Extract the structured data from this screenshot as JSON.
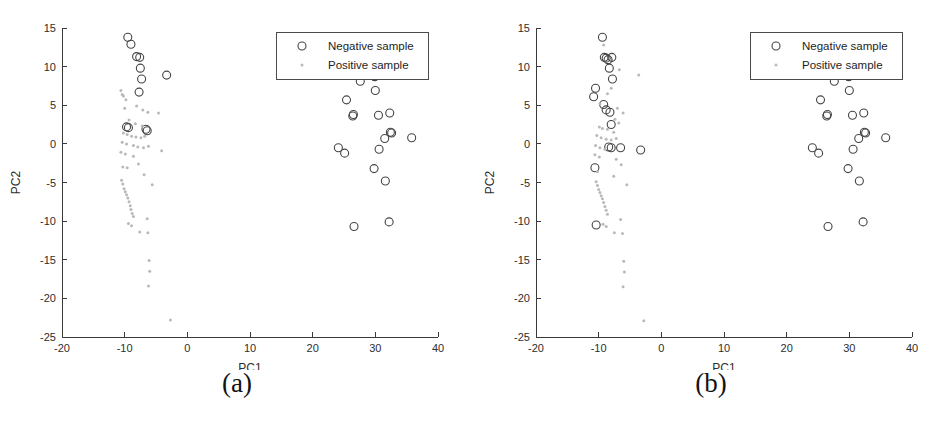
{
  "figure": {
    "panels": [
      {
        "caption": "(a)",
        "name": "panel-a"
      },
      {
        "caption": "(b)",
        "name": "panel-b"
      }
    ]
  },
  "legend": {
    "negative_label": "Negative sample",
    "positive_label": "Positive sample",
    "negative_marker": "circle-marker",
    "positive_marker": "dot-marker"
  },
  "colors": {
    "negative_marker": "#444444",
    "positive_marker": "#b9b9b9",
    "axis": "#3a3a3a",
    "text": "#2e2e2e",
    "background": "#ffffff"
  },
  "chart_data": [
    {
      "type": "scatter",
      "title": "(a)",
      "xlabel": "PC1",
      "ylabel": "PC2",
      "xlim": [
        -20,
        40
      ],
      "ylim": [
        -25,
        15
      ],
      "xticks": [
        -20,
        -10,
        0,
        10,
        20,
        30,
        40
      ],
      "yticks": [
        15,
        10,
        5,
        0,
        -5,
        -10,
        -15,
        -20,
        -25
      ],
      "grid": false,
      "legend_position": "top-right",
      "series": [
        {
          "name": "Negative sample",
          "marker": "circle",
          "points": [
            [
              -9.5,
              13.8
            ],
            [
              -9.0,
              12.9
            ],
            [
              -8.1,
              11.3
            ],
            [
              -7.6,
              11.2
            ],
            [
              -7.5,
              9.8
            ],
            [
              -7.3,
              8.4
            ],
            [
              -7.7,
              6.7
            ],
            [
              -3.3,
              8.9
            ],
            [
              -9.7,
              2.2
            ],
            [
              -9.4,
              2.1
            ],
            [
              -6.6,
              1.9
            ],
            [
              -6.4,
              1.7
            ],
            [
              27.6,
              8.1
            ],
            [
              29.9,
              8.7
            ],
            [
              30.0,
              6.9
            ],
            [
              25.4,
              5.7
            ],
            [
              26.5,
              3.8
            ],
            [
              26.4,
              3.6
            ],
            [
              30.5,
              3.7
            ],
            [
              32.3,
              4.0
            ],
            [
              32.4,
              1.5
            ],
            [
              32.6,
              1.4
            ],
            [
              31.5,
              0.7
            ],
            [
              35.8,
              0.8
            ],
            [
              24.1,
              -0.5
            ],
            [
              25.1,
              -1.2
            ],
            [
              30.6,
              -0.7
            ],
            [
              29.8,
              -3.2
            ],
            [
              31.6,
              -4.8
            ],
            [
              26.6,
              -10.7
            ],
            [
              32.2,
              -10.1
            ]
          ]
        },
        {
          "name": "Positive sample",
          "marker": "dot",
          "points": [
            [
              -10.6,
              6.9
            ],
            [
              -10.4,
              6.4
            ],
            [
              -10.2,
              6.2
            ],
            [
              -9.8,
              5.7
            ],
            [
              -10.0,
              4.6
            ],
            [
              -8.1,
              4.9
            ],
            [
              -7.1,
              4.4
            ],
            [
              -6.3,
              4.1
            ],
            [
              -4.6,
              4.0
            ],
            [
              -9.3,
              3.1
            ],
            [
              -8.3,
              2.6
            ],
            [
              -7.2,
              2.3
            ],
            [
              -10.2,
              1.4
            ],
            [
              -9.6,
              1.2
            ],
            [
              -8.9,
              1.0
            ],
            [
              -8.2,
              0.9
            ],
            [
              -7.4,
              0.8
            ],
            [
              -6.8,
              1.0
            ],
            [
              -10.4,
              0.2
            ],
            [
              -9.7,
              0.0
            ],
            [
              -8.6,
              -0.2
            ],
            [
              -7.9,
              -0.4
            ],
            [
              -7.0,
              -0.5
            ],
            [
              -6.2,
              -0.3
            ],
            [
              -4.1,
              -0.9
            ],
            [
              -10.6,
              -1.1
            ],
            [
              -9.9,
              -1.3
            ],
            [
              -8.6,
              -1.6
            ],
            [
              -10.3,
              -3.0
            ],
            [
              -9.6,
              -3.1
            ],
            [
              -7.8,
              -2.6
            ],
            [
              -6.9,
              -4.0
            ],
            [
              -5.6,
              -5.3
            ],
            [
              -10.5,
              -4.7
            ],
            [
              -10.3,
              -5.2
            ],
            [
              -10.1,
              -5.8
            ],
            [
              -9.9,
              -6.2
            ],
            [
              -9.7,
              -6.6
            ],
            [
              -9.5,
              -7.0
            ],
            [
              -9.3,
              -7.5
            ],
            [
              -9.1,
              -8.0
            ],
            [
              -9.0,
              -8.5
            ],
            [
              -8.8,
              -9.0
            ],
            [
              -8.6,
              -9.4
            ],
            [
              -6.4,
              -9.7
            ],
            [
              -9.4,
              -10.3
            ],
            [
              -8.9,
              -10.6
            ],
            [
              -7.6,
              -11.4
            ],
            [
              -6.3,
              -11.5
            ],
            [
              -6.1,
              -15.1
            ],
            [
              -6.0,
              -16.5
            ],
            [
              -6.2,
              -18.4
            ],
            [
              -2.7,
              -22.8
            ]
          ]
        }
      ]
    },
    {
      "type": "scatter",
      "title": "(b)",
      "xlabel": "PC1",
      "ylabel": "PC2",
      "xlim": [
        -20,
        40
      ],
      "ylim": [
        -25,
        15
      ],
      "xticks": [
        -20,
        -10,
        0,
        10,
        20,
        30,
        40
      ],
      "yticks": [
        15,
        10,
        5,
        0,
        -5,
        -10,
        -15,
        -20,
        -25
      ],
      "grid": false,
      "legend_position": "top-right",
      "series": [
        {
          "name": "Negative sample",
          "marker": "circle",
          "points": [
            [
              -9.4,
              13.8
            ],
            [
              -9.1,
              11.2
            ],
            [
              -8.8,
              11.1
            ],
            [
              -8.5,
              10.9
            ],
            [
              -7.9,
              11.2
            ],
            [
              -8.3,
              9.8
            ],
            [
              -7.8,
              8.4
            ],
            [
              -10.5,
              7.2
            ],
            [
              -10.8,
              6.1
            ],
            [
              -9.2,
              5.1
            ],
            [
              -8.8,
              4.4
            ],
            [
              -8.2,
              4.1
            ],
            [
              -8.0,
              2.5
            ],
            [
              -8.4,
              -0.4
            ],
            [
              -8.0,
              -0.5
            ],
            [
              -6.5,
              -0.5
            ],
            [
              -3.3,
              -0.8
            ],
            [
              -10.6,
              -3.1
            ],
            [
              -10.4,
              -10.5
            ],
            [
              27.6,
              8.1
            ],
            [
              29.9,
              8.7
            ],
            [
              30.0,
              6.9
            ],
            [
              25.4,
              5.7
            ],
            [
              26.5,
              3.8
            ],
            [
              26.4,
              3.6
            ],
            [
              30.5,
              3.7
            ],
            [
              32.3,
              4.0
            ],
            [
              32.4,
              1.5
            ],
            [
              32.6,
              1.4
            ],
            [
              31.5,
              0.7
            ],
            [
              35.8,
              0.8
            ],
            [
              24.1,
              -0.5
            ],
            [
              25.1,
              -1.2
            ],
            [
              30.6,
              -0.7
            ],
            [
              29.8,
              -3.2
            ],
            [
              31.6,
              -4.8
            ],
            [
              26.6,
              -10.7
            ],
            [
              32.2,
              -10.1
            ]
          ]
        },
        {
          "name": "Positive sample",
          "marker": "dot",
          "points": [
            [
              -9.2,
              12.8
            ],
            [
              -6.7,
              9.6
            ],
            [
              -3.6,
              8.9
            ],
            [
              -8.0,
              7.2
            ],
            [
              -8.6,
              6.5
            ],
            [
              -9.8,
              5.2
            ],
            [
              -7.0,
              4.6
            ],
            [
              -6.1,
              4.0
            ],
            [
              -7.4,
              3.2
            ],
            [
              -6.8,
              2.7
            ],
            [
              -9.9,
              2.2
            ],
            [
              -9.4,
              2.0
            ],
            [
              -8.6,
              1.9
            ],
            [
              -7.6,
              1.5
            ],
            [
              -10.3,
              1.1
            ],
            [
              -9.6,
              0.8
            ],
            [
              -8.8,
              0.6
            ],
            [
              -8.0,
              0.5
            ],
            [
              -7.2,
              0.7
            ],
            [
              -10.5,
              -0.2
            ],
            [
              -9.8,
              -0.5
            ],
            [
              -9.0,
              -0.7
            ],
            [
              -10.6,
              -1.4
            ],
            [
              -9.9,
              -1.7
            ],
            [
              -7.2,
              -2.0
            ],
            [
              -6.4,
              -2.7
            ],
            [
              -10.2,
              -3.6
            ],
            [
              -7.6,
              -4.2
            ],
            [
              -5.5,
              -5.3
            ],
            [
              -10.4,
              -4.9
            ],
            [
              -10.2,
              -5.4
            ],
            [
              -10.0,
              -5.9
            ],
            [
              -9.8,
              -6.3
            ],
            [
              -9.6,
              -6.7
            ],
            [
              -9.4,
              -7.1
            ],
            [
              -9.2,
              -7.6
            ],
            [
              -9.0,
              -8.1
            ],
            [
              -8.8,
              -8.6
            ],
            [
              -8.6,
              -9.1
            ],
            [
              -6.5,
              -9.8
            ],
            [
              -9.3,
              -10.4
            ],
            [
              -8.8,
              -10.7
            ],
            [
              -7.5,
              -11.5
            ],
            [
              -6.2,
              -11.6
            ],
            [
              -6.0,
              -15.2
            ],
            [
              -5.9,
              -16.6
            ],
            [
              -6.1,
              -18.5
            ],
            [
              -2.8,
              -22.9
            ]
          ]
        }
      ]
    }
  ]
}
